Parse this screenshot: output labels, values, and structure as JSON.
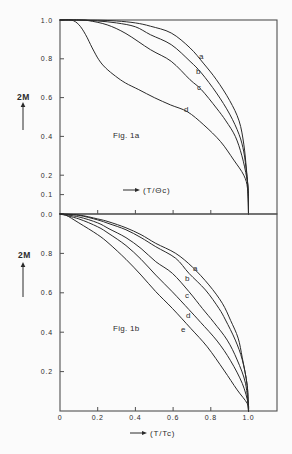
{
  "chart_data": [
    {
      "type": "line",
      "title": "Fig. 1a",
      "xlabel": "(T/Θc)",
      "ylabel": "2M",
      "xlim": [
        0,
        1.15
      ],
      "ylim": [
        0,
        1.0
      ],
      "grid": false,
      "legend": "none (curves labelled inline a–d)",
      "yticks": [
        1.0,
        0.8,
        0.6,
        0.4,
        0.2,
        0.1,
        0.0
      ],
      "ytick_labels": [
        "1.0",
        "0.8",
        "0.6",
        "0.4",
        "0.2",
        "0.1",
        "0.0"
      ],
      "xticks": [
        0.2,
        0.4,
        0.6,
        0.8
      ],
      "xtick_labels": [],
      "series": [
        {
          "name": "a",
          "x": [
            0,
            0.1,
            0.2,
            0.3,
            0.4,
            0.48,
            0.59,
            0.69,
            0.76,
            0.83,
            0.9,
            0.95,
            0.975,
            0.99,
            0.998,
            1.0
          ],
          "y": [
            1.0,
            1.0,
            0.999,
            0.995,
            0.985,
            0.968,
            0.933,
            0.856,
            0.778,
            0.692,
            0.585,
            0.48,
            0.36,
            0.22,
            0.12,
            0.0
          ]
        },
        {
          "name": "b",
          "x": [
            0,
            0.1,
            0.2,
            0.3,
            0.4,
            0.48,
            0.59,
            0.69,
            0.75,
            0.83,
            0.9,
            0.95,
            0.975,
            0.99,
            0.998,
            1.0
          ],
          "y": [
            1.0,
            1.0,
            0.995,
            0.985,
            0.965,
            0.924,
            0.873,
            0.787,
            0.727,
            0.624,
            0.515,
            0.41,
            0.32,
            0.21,
            0.12,
            0.0
          ]
        },
        {
          "name": "c",
          "x": [
            0,
            0.1,
            0.15,
            0.25,
            0.35,
            0.48,
            0.59,
            0.69,
            0.75,
            0.83,
            0.88,
            0.93,
            0.965,
            0.99,
            0.998,
            1.0
          ],
          "y": [
            1.0,
            1.0,
            0.997,
            0.975,
            0.93,
            0.847,
            0.787,
            0.692,
            0.641,
            0.546,
            0.48,
            0.4,
            0.3,
            0.19,
            0.12,
            0.0
          ]
        },
        {
          "name": "d",
          "x": [
            0,
            0.06,
            0.1,
            0.136,
            0.171,
            0.206,
            0.242,
            0.295,
            0.348,
            0.418,
            0.5,
            0.587,
            0.676,
            0.763,
            0.852,
            0.922,
            0.975,
            0.995,
            1.0
          ],
          "y": [
            1.0,
            1.0,
            0.976,
            0.924,
            0.856,
            0.795,
            0.753,
            0.71,
            0.675,
            0.641,
            0.6,
            0.562,
            0.527,
            0.459,
            0.373,
            0.278,
            0.2,
            0.13,
            0.0
          ]
        }
      ]
    },
    {
      "type": "line",
      "title": "Fig. 1b",
      "xlabel": "(T/Tc)",
      "ylabel": "2M",
      "xlim": [
        0,
        1.15
      ],
      "ylim": [
        0,
        1.0
      ],
      "grid": false,
      "legend": "none (curves labelled inline a–e)",
      "yticks": [
        0.8,
        0.6,
        0.4,
        0.2
      ],
      "ytick_labels": [
        "0.8",
        "0.6",
        "0.4",
        "0.2"
      ],
      "xticks": [
        0,
        0.2,
        0.4,
        0.6,
        0.8,
        1.0
      ],
      "xtick_labels": [
        "0",
        "0.2",
        "0.4",
        "0.6",
        "0.8",
        "1.0"
      ],
      "series": [
        {
          "name": "a",
          "x": [
            0,
            0.1,
            0.2,
            0.26,
            0.35,
            0.43,
            0.508,
            0.614,
            0.702,
            0.79,
            0.861,
            0.905,
            0.945,
            0.967,
            0.993,
            1.0
          ],
          "y": [
            1.0,
            0.995,
            0.975,
            0.96,
            0.93,
            0.895,
            0.851,
            0.8,
            0.731,
            0.64,
            0.547,
            0.46,
            0.37,
            0.27,
            0.13,
            0.0
          ]
        },
        {
          "name": "b",
          "x": [
            0,
            0.1,
            0.2,
            0.26,
            0.35,
            0.43,
            0.508,
            0.614,
            0.684,
            0.772,
            0.843,
            0.878,
            0.93,
            0.967,
            0.993,
            1.0
          ],
          "y": [
            1.0,
            0.993,
            0.97,
            0.951,
            0.92,
            0.88,
            0.834,
            0.775,
            0.699,
            0.614,
            0.521,
            0.462,
            0.36,
            0.26,
            0.13,
            0.0
          ]
        },
        {
          "name": "c",
          "x": [
            0,
            0.1,
            0.2,
            0.26,
            0.35,
            0.43,
            0.508,
            0.596,
            0.684,
            0.755,
            0.816,
            0.887,
            0.94,
            0.984,
            1.0
          ],
          "y": [
            1.0,
            0.985,
            0.955,
            0.925,
            0.88,
            0.825,
            0.758,
            0.699,
            0.606,
            0.521,
            0.45,
            0.36,
            0.259,
            0.141,
            0.0
          ]
        },
        {
          "name": "d",
          "x": [
            0,
            0.1,
            0.2,
            0.26,
            0.35,
            0.43,
            0.508,
            0.596,
            0.684,
            0.746,
            0.834,
            0.905,
            0.967,
            0.998,
            1.0
          ],
          "y": [
            1.0,
            0.975,
            0.935,
            0.9,
            0.84,
            0.77,
            0.69,
            0.605,
            0.515,
            0.45,
            0.355,
            0.255,
            0.14,
            0.04,
            0.0
          ]
        },
        {
          "name": "e",
          "x": [
            0,
            0.03,
            0.1,
            0.2,
            0.26,
            0.35,
            0.43,
            0.508,
            0.596,
            0.693,
            0.781,
            0.869,
            0.94,
            0.993,
            1.0
          ],
          "y": [
            1.0,
            0.995,
            0.955,
            0.895,
            0.85,
            0.77,
            0.69,
            0.606,
            0.521,
            0.42,
            0.326,
            0.208,
            0.107,
            0.039,
            0.0
          ]
        }
      ]
    }
  ]
}
